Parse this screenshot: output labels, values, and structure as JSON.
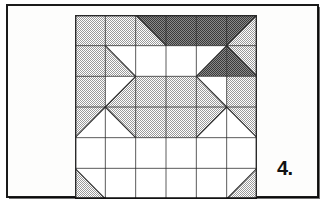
{
  "page": {
    "background": "#ffffff",
    "frame_color": "#1a1a1a",
    "width": 327,
    "height": 205
  },
  "label": {
    "text": "4.",
    "name": "figure-number-label"
  },
  "palette": {
    "white": "#ffffff",
    "light_gray": "#c9c9c9",
    "mid_gray": "#a8a8a8",
    "dark_gray": "#6e6e6e",
    "line": "#2a2a2a"
  },
  "block": {
    "title": "quilt-block-diagram",
    "grid_rows": 6,
    "grid_cols": 6,
    "cell_px": 30,
    "origin_x": 67,
    "origin_y": 9,
    "width": 182,
    "height": 184
  },
  "chart_data": {
    "type": "table",
    "xlabel": "column",
    "ylabel": "row",
    "categories": [
      "c1",
      "c2",
      "c3",
      "c4",
      "c5",
      "c6"
    ],
    "row_labels": [
      "r1",
      "r2",
      "r3",
      "r4",
      "r5",
      "r6"
    ],
    "legend": [
      "white",
      "light gray",
      "dark gray"
    ],
    "cells": [
      [
        {
          "kind": "solid",
          "fill": "light"
        },
        {
          "kind": "solid",
          "fill": "light"
        },
        {
          "kind": "diag",
          "a": "light",
          "b": "dark",
          "dir": "tl-br"
        },
        {
          "kind": "solid",
          "fill": "dark"
        },
        {
          "kind": "solid",
          "fill": "dark"
        },
        {
          "kind": "diag",
          "a": "dark",
          "b": "light",
          "dir": "bl-tr"
        }
      ],
      [
        {
          "kind": "solid",
          "fill": "light"
        },
        {
          "kind": "diag",
          "a": "light",
          "b": "white",
          "dir": "tl-br"
        },
        {
          "kind": "solid",
          "fill": "white"
        },
        {
          "kind": "solid",
          "fill": "white"
        },
        {
          "kind": "diag",
          "a": "white",
          "b": "dark",
          "dir": "bl-tr"
        },
        {
          "kind": "diag",
          "a": "dark",
          "b": "light",
          "dir": "tl-br"
        }
      ],
      [
        {
          "kind": "solid",
          "fill": "light"
        },
        {
          "kind": "diag",
          "a": "white",
          "b": "light",
          "dir": "bl-tr"
        },
        {
          "kind": "solid",
          "fill": "light"
        },
        {
          "kind": "solid",
          "fill": "light"
        },
        {
          "kind": "diag",
          "a": "light",
          "b": "white",
          "dir": "tl-br"
        },
        {
          "kind": "solid",
          "fill": "light"
        }
      ],
      [
        {
          "kind": "diag",
          "a": "light",
          "b": "white",
          "dir": "bl-tr"
        },
        {
          "kind": "diag",
          "a": "white",
          "b": "light",
          "dir": "tl-br"
        },
        {
          "kind": "solid",
          "fill": "light"
        },
        {
          "kind": "solid",
          "fill": "light"
        },
        {
          "kind": "diag",
          "a": "light",
          "b": "white",
          "dir": "bl-tr"
        },
        {
          "kind": "diag",
          "a": "white",
          "b": "light",
          "dir": "tl-br"
        }
      ],
      [
        {
          "kind": "solid",
          "fill": "white"
        },
        {
          "kind": "solid",
          "fill": "white"
        },
        {
          "kind": "solid",
          "fill": "white"
        },
        {
          "kind": "solid",
          "fill": "white"
        },
        {
          "kind": "solid",
          "fill": "white"
        },
        {
          "kind": "solid",
          "fill": "white"
        }
      ],
      [
        {
          "kind": "diag",
          "a": "light",
          "b": "white",
          "dir": "tl-br"
        },
        {
          "kind": "solid",
          "fill": "white"
        },
        {
          "kind": "solid",
          "fill": "white"
        },
        {
          "kind": "solid",
          "fill": "white"
        },
        {
          "kind": "solid",
          "fill": "white"
        },
        {
          "kind": "diag",
          "a": "white",
          "b": "light",
          "dir": "bl-tr"
        }
      ]
    ]
  }
}
